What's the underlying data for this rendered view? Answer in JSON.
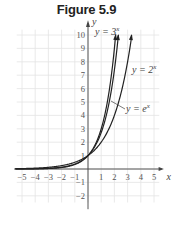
{
  "figure": {
    "title": "Figure 5.9"
  },
  "chart_data": {
    "type": "line",
    "title": "Figure 5.9",
    "xlabel": "x",
    "ylabel": "y",
    "xlim": [
      -5.5,
      5.5
    ],
    "ylim": [
      -2.5,
      10.5
    ],
    "x_ticks": [
      "-5",
      "-4",
      "-3",
      "-2",
      "-1",
      "1",
      "2",
      "3",
      "4",
      "5"
    ],
    "y_ticks": [
      "-2",
      "-1",
      "1",
      "2",
      "3",
      "4",
      "5",
      "6",
      "7",
      "8",
      "9",
      "10"
    ],
    "grid": true,
    "series": [
      {
        "name": "y = 3^x",
        "label": "y = 3",
        "exp": "x",
        "function": "3^x",
        "x": [
          -5,
          -4,
          -3,
          -2,
          -1,
          0,
          1,
          2,
          2.1
        ],
        "values": [
          0.004,
          0.012,
          0.037,
          0.111,
          0.333,
          1,
          3,
          9,
          10
        ]
      },
      {
        "name": "y = e^x",
        "label": "y = e",
        "exp": "x",
        "function": "e^x",
        "x": [
          -5,
          -4,
          -3,
          -2,
          -1,
          0,
          1,
          2,
          2.3
        ],
        "values": [
          0.007,
          0.018,
          0.05,
          0.135,
          0.368,
          1,
          2.718,
          7.389,
          10
        ]
      },
      {
        "name": "y = 2^x",
        "label": "y = 2",
        "exp": "x",
        "function": "2^x",
        "x": [
          -5,
          -4,
          -3,
          -2,
          -1,
          0,
          1,
          2,
          3,
          3.3
        ],
        "values": [
          0.031,
          0.063,
          0.125,
          0.25,
          0.5,
          1,
          2,
          4,
          8,
          10
        ]
      }
    ]
  }
}
